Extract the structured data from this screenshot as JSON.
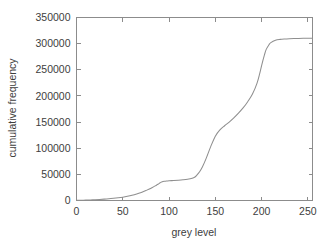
{
  "chart_data": {
    "type": "line",
    "title": "",
    "xlabel": "grey level",
    "ylabel": "cumulative frequency",
    "xlim": [
      0,
      255
    ],
    "ylim": [
      0,
      350000
    ],
    "grid": false,
    "legend": false,
    "legend_position": "none",
    "line_color": "#8f8f8f",
    "x_ticks": [
      0,
      50,
      100,
      150,
      200,
      250
    ],
    "x_tick_labels": [
      "0",
      "50",
      "100",
      "150",
      "200",
      "250"
    ],
    "y_ticks": [
      0,
      50000,
      100000,
      150000,
      200000,
      250000,
      300000,
      350000
    ],
    "y_tick_labels": [
      "0",
      "50000",
      "100000",
      "150000",
      "200000",
      "250000",
      "300000",
      "350000"
    ],
    "series": [
      {
        "name": "cumulative frequency",
        "x": [
          0,
          5,
          10,
          15,
          20,
          25,
          30,
          35,
          40,
          45,
          50,
          55,
          60,
          65,
          70,
          75,
          80,
          85,
          88,
          90,
          92,
          95,
          98,
          100,
          105,
          110,
          115,
          120,
          125,
          128,
          130,
          133,
          136,
          140,
          145,
          150,
          155,
          160,
          165,
          170,
          175,
          180,
          185,
          190,
          195,
          198,
          200,
          203,
          205,
          208,
          210,
          215,
          220,
          225,
          230,
          235,
          240,
          245,
          250,
          255
        ],
        "values": [
          300,
          500,
          800,
          1100,
          1500,
          2000,
          2600,
          3300,
          4200,
          5200,
          6400,
          8000,
          10000,
          12500,
          15500,
          19000,
          23000,
          28000,
          31000,
          33500,
          35200,
          36600,
          37300,
          37700,
          38300,
          38900,
          39600,
          40600,
          42500,
          45000,
          48500,
          55000,
          64000,
          80000,
          103000,
          123000,
          135000,
          143000,
          150000,
          158000,
          167000,
          177000,
          189000,
          203000,
          224000,
          243000,
          258000,
          278000,
          289000,
          298000,
          302000,
          306500,
          308200,
          309000,
          309500,
          309800,
          310000,
          310200,
          310400,
          310500
        ]
      }
    ]
  },
  "axes": {
    "x_label": "grey level",
    "y_label": "cumulative frequency"
  }
}
